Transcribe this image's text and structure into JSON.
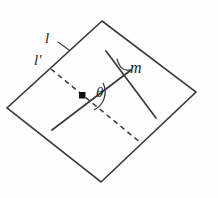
{
  "figure": {
    "type": "geometry-diagram",
    "background_color": "#fefefe",
    "stroke_color": "#3b3b3b",
    "dot_color": "#111111",
    "labels": {
      "line_l": "l",
      "line_l_prime": "l′",
      "line_m": "m",
      "angle": "θ"
    },
    "geometry": {
      "plane": {
        "name": "plane-parallelogram",
        "points": "102,21 196,92 101,182 7,108"
      },
      "line_l": {
        "name": "line-l",
        "style": "solid",
        "x1": 52,
        "y1": 130,
        "x2": 131,
        "y2": 70
      },
      "line_l_prime": {
        "name": "line-l-prime",
        "style": "dashed",
        "x1": 51,
        "y1": 69,
        "x2": 141,
        "y2": 143
      },
      "line_m": {
        "name": "line-m",
        "style": "solid",
        "x1": 106,
        "y1": 51,
        "x2": 156,
        "y2": 118
      },
      "intersection_dot": {
        "name": "intersection-dot",
        "cx": 82,
        "cy": 96,
        "size": 5
      },
      "angle_arc": {
        "name": "angle-arc-theta",
        "path": "M 104 84 A 22 22 0 0 1 95 110"
      },
      "m_leader": {
        "name": "m-leader-line",
        "path": "M 117 60 C 121 70 124 71 130 70"
      }
    }
  }
}
